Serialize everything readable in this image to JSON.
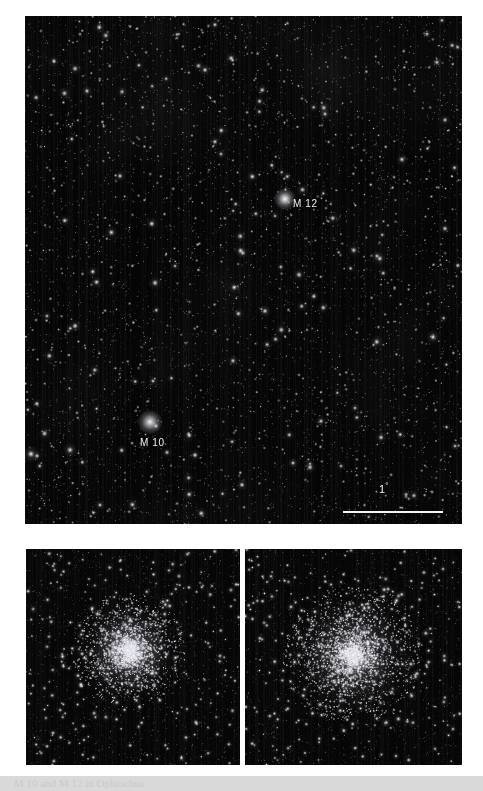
{
  "figure": {
    "background_color": "#ffffff",
    "sky_color": "#050505"
  },
  "main_field": {
    "name": "wide-field-star-chart",
    "labels": [
      {
        "id": "m12",
        "text": "M 12",
        "x": 268,
        "y": 182
      },
      {
        "id": "m10",
        "text": "M 10",
        "x": 115,
        "y": 421
      }
    ],
    "scale_bar": {
      "label": "1",
      "unit": "°",
      "length_px": 100
    }
  },
  "detail_panels": [
    {
      "id": "detail-left",
      "object": "M 10",
      "caption": ""
    },
    {
      "id": "detail-right",
      "object": "M 12",
      "caption": ""
    }
  ],
  "caption": {
    "text": "M 10 and M 12 in Ophiuchus"
  },
  "chart_data": {
    "type": "scatter",
    "xlabel": "",
    "ylabel": "",
    "annotations": [
      "M 12",
      "M 10",
      "1°"
    ],
    "legend": [],
    "panels": [
      {
        "name": "wide-field",
        "objects": [
          {
            "label": "M 12",
            "x": 0.59,
            "y": 0.36,
            "type": "globular-cluster"
          },
          {
            "label": "M 10",
            "x": 0.27,
            "y": 0.81,
            "type": "globular-cluster"
          }
        ],
        "scale_bar_degrees": 1
      },
      {
        "name": "detail-m10",
        "objects": [
          {
            "label": "M 10",
            "x": 0.5,
            "y": 0.5,
            "type": "globular-cluster"
          }
        ]
      },
      {
        "name": "detail-m12",
        "objects": [
          {
            "label": "M 12",
            "x": 0.5,
            "y": 0.5,
            "type": "globular-cluster"
          }
        ]
      }
    ]
  }
}
